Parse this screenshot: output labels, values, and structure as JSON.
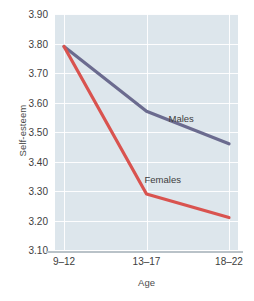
{
  "chart_data": {
    "type": "line",
    "title": "",
    "xlabel": "Age",
    "ylabel": "Self-esteem",
    "categories": [
      "9–12",
      "13–17",
      "18–22"
    ],
    "ylim": [
      3.1,
      3.9
    ],
    "yticks": [
      "3.10",
      "3.20",
      "3.30",
      "3.40",
      "3.50",
      "3.60",
      "3.70",
      "3.80",
      "3.90"
    ],
    "ytick_values": [
      3.1,
      3.2,
      3.3,
      3.4,
      3.5,
      3.6,
      3.7,
      3.8,
      3.9
    ],
    "grid": true,
    "legend_position": "inline-annotation",
    "series": [
      {
        "name": "Males",
        "values": [
          3.79,
          3.57,
          3.46
        ],
        "color": "#6b6b8f"
      },
      {
        "name": "Females",
        "values": [
          3.79,
          3.29,
          3.21
        ],
        "color": "#d9534f"
      }
    ],
    "annotations": [
      {
        "text": "Males",
        "series": "Males"
      },
      {
        "text": "Females",
        "series": "Females"
      }
    ]
  },
  "style": {
    "plot_background": "#dde6ec",
    "gridline_color": "#ffffff",
    "axis_color": "#b9c2c8",
    "text_color": "#3d3d3d",
    "page_background": "#ffffff"
  }
}
